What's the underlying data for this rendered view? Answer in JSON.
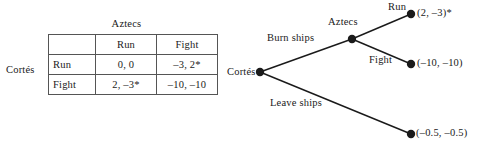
{
  "figure": {
    "background": "#ffffff",
    "ink": "#1a1a1a"
  },
  "normal_form": {
    "column_player": "Aztecs",
    "row_player": "Cortés",
    "corner": "",
    "column_headers": [
      "Run",
      "Fight"
    ],
    "row_headers": [
      "Run",
      "Fight"
    ],
    "cells": [
      [
        "0,  0",
        "–3,    2*"
      ],
      [
        "2, –3*",
        "–10, –10"
      ]
    ]
  },
  "extensive_form": {
    "nodes": {
      "root": {
        "label": "Cortés",
        "x": 30,
        "y": 72
      },
      "decision": {
        "label": "Aztecs",
        "x": 122,
        "y": 39
      },
      "terminal_run": {
        "x": 181,
        "y": 14
      },
      "terminal_fight": {
        "x": 181,
        "y": 64
      },
      "terminal_leave": {
        "x": 181,
        "y": 134
      }
    },
    "edges": [
      {
        "label": "Burn ships",
        "from": "root",
        "to": "decision"
      },
      {
        "label": "Leave ships",
        "from": "root",
        "to": "terminal_leave"
      },
      {
        "label": "Run",
        "from": "decision",
        "to": "terminal_run"
      },
      {
        "label": "Fight",
        "from": "decision",
        "to": "terminal_fight"
      }
    ],
    "payoffs": {
      "run": "(2, –3)*",
      "fight": "(–10, –10)",
      "leave": "(–0.5, –0.5)"
    }
  }
}
